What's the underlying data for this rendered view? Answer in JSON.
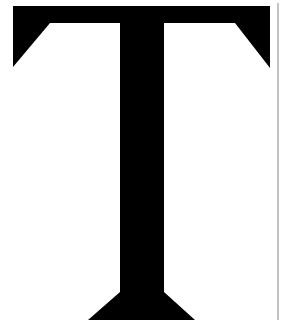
{
  "glyph": {
    "character": "T",
    "fill": "#000000",
    "background": "#ffffff"
  },
  "rule": {
    "color": "#9a9a9a"
  }
}
